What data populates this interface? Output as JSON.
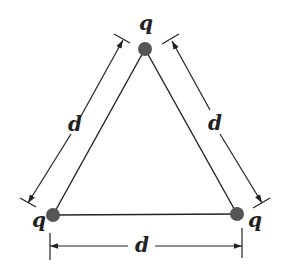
{
  "diagram": {
    "charges": [
      {
        "id": "top",
        "label": "q",
        "x": 145,
        "y": 49
      },
      {
        "id": "bottom-left",
        "label": "q",
        "x": 53,
        "y": 215
      },
      {
        "id": "bottom-right",
        "label": "q",
        "x": 237,
        "y": 214
      }
    ],
    "dimensions": [
      {
        "side": "left",
        "label": "d"
      },
      {
        "side": "right",
        "label": "d"
      },
      {
        "side": "bottom",
        "label": "d"
      }
    ],
    "colors": {
      "charge": "#555555",
      "line": "#222222",
      "background": "#ffffff"
    }
  }
}
